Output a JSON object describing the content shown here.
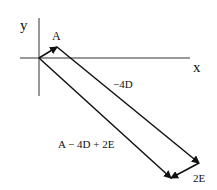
{
  "diagram": {
    "type": "vector-addition",
    "axes": {
      "x_label": "x",
      "y_label": "y"
    },
    "vectors": [
      {
        "name": "A",
        "label": "A"
      },
      {
        "name": "-4D",
        "label": "−4D"
      },
      {
        "name": "2E",
        "label": "2E"
      },
      {
        "name": "resultant",
        "label": "A − 4D + 2E"
      }
    ]
  }
}
